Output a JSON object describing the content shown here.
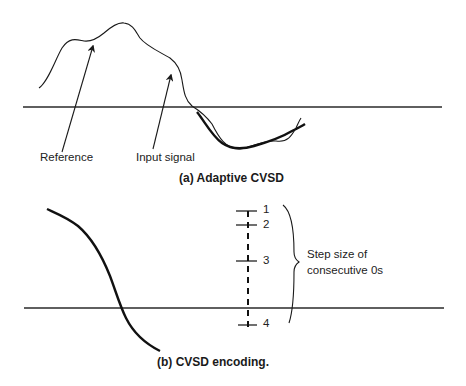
{
  "panel_a": {
    "caption": "(a) Adaptive CVSD",
    "labels": {
      "reference": "Reference",
      "input_signal": "Input signal"
    }
  },
  "panel_b": {
    "caption": "(b) CVSD encoding.",
    "step_labels": [
      "1",
      "2",
      "3",
      "4"
    ],
    "brace_text_line1": "Step size of",
    "brace_text_line2": "consecutive 0s"
  },
  "colors": {
    "ink": "#1a1a1a",
    "background": "#ffffff"
  }
}
